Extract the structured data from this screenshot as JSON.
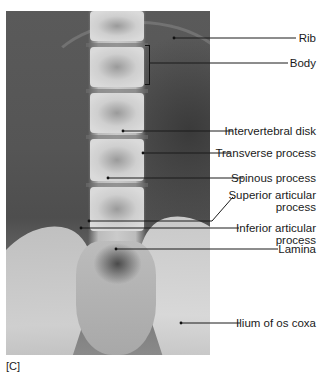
{
  "figure": {
    "panel_label": "[C]",
    "image_type": "AP radiograph of lumbar spine",
    "labels": [
      {
        "id": "rib",
        "text": "Rib"
      },
      {
        "id": "body",
        "text": "Body"
      },
      {
        "id": "intervertebral-disk",
        "text": "Intervertebral disk"
      },
      {
        "id": "transverse-process",
        "text": "Transverse process"
      },
      {
        "id": "spinous-process",
        "text": "Spinous process"
      },
      {
        "id": "superior-articular-process",
        "line1": "Superior articular",
        "line2": "process"
      },
      {
        "id": "inferior-articular-process",
        "line1": "Inferior articular",
        "line2": "process"
      },
      {
        "id": "lamina",
        "text": "Lamina"
      },
      {
        "id": "ilium",
        "text": "Ilium of os coxa"
      }
    ]
  }
}
